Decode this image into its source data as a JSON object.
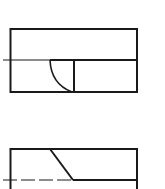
{
  "diagram": {
    "type": "technical-drawing",
    "views": [
      {
        "name": "top-view",
        "outline": {
          "x": 10,
          "y": 29,
          "width": 127,
          "height": 63
        },
        "center_line_y": 60,
        "center_line_start_x": 3,
        "inner_vertical_x": 74,
        "arc": {
          "start": [
            50,
            60
          ],
          "end": [
            72,
            92
          ]
        }
      },
      {
        "name": "front-view",
        "outline_top_y": 149,
        "left_x": 10,
        "right_x": 137,
        "diagonal": {
          "start": [
            50,
            149
          ],
          "end": [
            73,
            180
          ]
        },
        "dashed_line_y": 180,
        "dashed_line_start_x": 3
      }
    ],
    "line_color": "#1a1a1a",
    "background": "#ffffff"
  }
}
